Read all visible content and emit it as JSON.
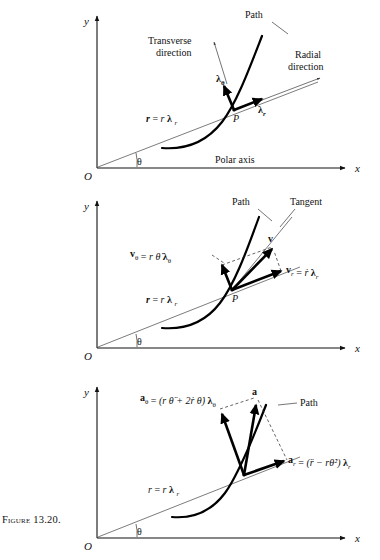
{
  "figure": {
    "caption": "Figure 13.20.",
    "topic": "Polar coordinate description of position, velocity and acceleration"
  },
  "axes": {
    "y_label": "y",
    "x_label": "x",
    "origin_label": "O",
    "theta_label": "θ"
  },
  "panel1": {
    "name": "unit-vectors-panel",
    "path_label": "Path",
    "transverse_label_line1": "Transverse",
    "transverse_label_line2": "direction",
    "radial_label_line1": "Radial",
    "radial_label_line2": "direction",
    "polar_axis_label": "Polar axis",
    "point_label": "P",
    "position_vector": {
      "lhs": "r",
      "eq": "=",
      "rhs_scalar": "r",
      "rhs_unit": "λ",
      "rhs_sub": "r"
    },
    "unit_transverse": {
      "symbol": "λ",
      "sub": "θ"
    },
    "unit_radial": {
      "symbol": "λ",
      "sub": "r"
    }
  },
  "panel2": {
    "name": "velocity-panel",
    "path_label": "Path",
    "tangent_label": "Tangent",
    "point_label": "P",
    "position_vector": {
      "lhs": "r",
      "eq": "=",
      "rhs_scalar": "r",
      "rhs_unit": "λ",
      "rhs_sub": "r"
    },
    "v_resultant": "v",
    "v_theta": {
      "lhs": "v",
      "lhs_sub": "θ",
      "eq": "=",
      "rhs": "r θ̇",
      "unit": "λ",
      "unit_sub": "θ"
    },
    "v_r": {
      "lhs": "v",
      "lhs_sub": "r",
      "eq": "=",
      "rhs": "ṙ",
      "unit": "λ",
      "unit_sub": "r"
    }
  },
  "panel3": {
    "name": "acceleration-panel",
    "path_label": "Path",
    "position_vector": {
      "lhs": "r",
      "eq": "=",
      "rhs_scalar": "r",
      "rhs_unit": "λ",
      "rhs_sub": "r"
    },
    "a_resultant": "a",
    "a_theta": {
      "lhs": "a",
      "lhs_sub": "θ",
      "eq": "=",
      "rhs": "(r θ̈ + 2ṙ θ̇)",
      "unit": "λ",
      "unit_sub": "θ"
    },
    "a_r": {
      "lhs": "a",
      "lhs_sub": "r",
      "eq": "=",
      "rhs": "(r̈ − rθ̇²)",
      "unit": "λ",
      "unit_sub": "r"
    }
  },
  "colors": {
    "ink": "#111111",
    "ray": "#5a5a5a",
    "background": "#ffffff"
  }
}
